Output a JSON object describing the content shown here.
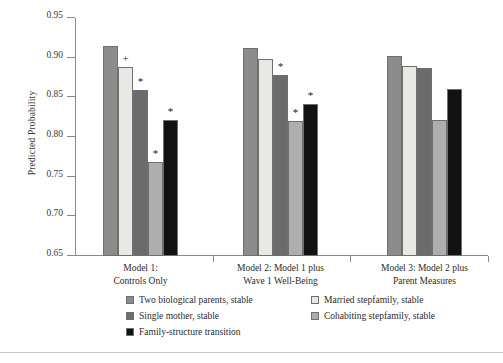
{
  "chart_data": {
    "type": "bar",
    "title": "",
    "xlabel": "",
    "ylabel": "Predicted Probability",
    "ylim": [
      0.65,
      0.95
    ],
    "yticks": [
      "0.95",
      "0.90",
      "0.85",
      "0.80",
      "0.75",
      "0.70",
      "0.65"
    ],
    "ytick_values": [
      0.95,
      0.9,
      0.85,
      0.8,
      0.75,
      0.7,
      0.65
    ],
    "grid": false,
    "legend_position": "bottom",
    "categories": [
      "Model 1:\nControls Only",
      "Model 2: Model 1 plus\nWave 1 Well-Being",
      "Model 3: Model 2 plus\nParent Measures"
    ],
    "category_lines": [
      [
        "Model 1:",
        "Controls Only"
      ],
      [
        "Model 2: Model 1 plus",
        "Wave 1 Well-Being"
      ],
      [
        "Model 3: Model 2 plus",
        "Parent Measures"
      ]
    ],
    "series": [
      {
        "name": "Two biological parents, stable",
        "color": "#8c8c8c",
        "values": [
          0.915,
          0.912,
          0.902
        ],
        "markers": [
          "",
          "",
          ""
        ]
      },
      {
        "name": "Married stepfamily, stable",
        "color": "#e8e8e4",
        "values": [
          0.888,
          0.898,
          0.889
        ],
        "markers": [
          "+",
          "",
          ""
        ]
      },
      {
        "name": "Single mother, stable",
        "color": "#6b6b6b",
        "values": [
          0.859,
          0.878,
          0.887
        ],
        "markers": [
          "*",
          "*",
          ""
        ]
      },
      {
        "name": "Cohabiting stepfamily, stable",
        "color": "#aeaeae",
        "values": [
          0.769,
          0.82,
          0.822
        ],
        "markers": [
          "*",
          "*",
          ""
        ]
      },
      {
        "name": "Family-structure transition",
        "color": "#111111",
        "values": [
          0.822,
          0.842,
          0.861
        ],
        "markers": [
          "*",
          "*",
          ""
        ]
      }
    ],
    "legend_entries": [
      {
        "label": "Two biological parents, stable",
        "color": "#8c8c8c"
      },
      {
        "label": "Married stepfamily, stable",
        "color": "#e8e8e4"
      },
      {
        "label": "Single mother, stable",
        "color": "#6b6b6b"
      },
      {
        "label": "Cohabiting stepfamily, stable",
        "color": "#aeaeae"
      },
      {
        "label": "Family-structure transition",
        "color": "#111111"
      }
    ],
    "significance_notes": {
      "plus": "+",
      "star": "*"
    }
  }
}
